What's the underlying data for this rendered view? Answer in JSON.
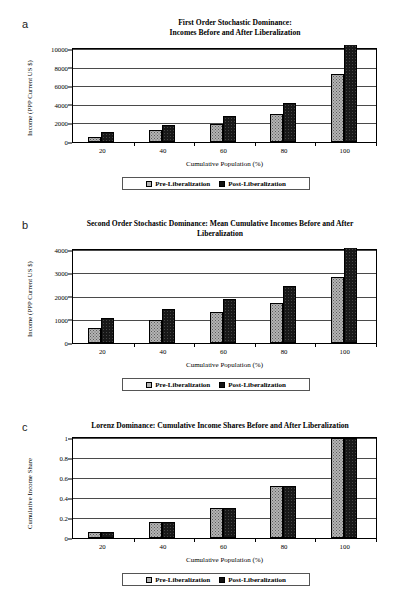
{
  "figure": {
    "legend": {
      "pre_label": "Pre-Liberalization",
      "post_label": "Post-Liberalization",
      "pre_color": "#b4b4b4",
      "post_color": "#181818"
    },
    "xaxis_title": "Cumulative Population (%)"
  },
  "panels": [
    {
      "letter": "a",
      "title": "First Order Stochastic Dominance:\nIncomes Before and After Liberalization",
      "title_line1": "First Order Stochastic Dominance:",
      "title_line2": "Incomes Before and After Liberalization",
      "ylabel": "Income (PPP Current US $)",
      "xlabel": "Cumulative Population (%)"
    },
    {
      "letter": "b",
      "title_line1": "Second Order Stochastic Dominance: Mean Cumulative Incomes Before and After",
      "title_line2": "Liberalization",
      "ylabel": "Income (PPP Current US $)",
      "xlabel": "Cumulative Population (%)"
    },
    {
      "letter": "c",
      "title_line1": "Lorenz Dominance: Cumulative Income Shares Before and After Liberalization",
      "title_line2": "",
      "ylabel": "Cumulative Income Share",
      "xlabel": "Cumulative Population (%)"
    }
  ],
  "chart_data": [
    {
      "type": "bar",
      "panel": "a",
      "title": "First Order Stochastic Dominance: Incomes Before and After Liberalization",
      "xlabel": "Cumulative Population (%)",
      "ylabel": "Income (PPP Current US $)",
      "categories": [
        "20",
        "40",
        "60",
        "80",
        "100"
      ],
      "series": [
        {
          "name": "Pre-Liberalization",
          "values": [
            560,
            1300,
            1950,
            3000,
            7300
          ]
        },
        {
          "name": "Post-Liberalization",
          "values": [
            1060,
            1850,
            2800,
            4150,
            10400
          ]
        }
      ],
      "ylim": [
        0,
        10000
      ],
      "yticks": [
        0,
        2000,
        4000,
        6000,
        8000,
        10000
      ],
      "ytick_labels": [
        "0",
        "2000",
        "4000",
        "6000",
        "8000",
        "10000"
      ],
      "grid": true,
      "legend_position": "bottom"
    },
    {
      "type": "bar",
      "panel": "b",
      "title": "Second Order Stochastic Dominance: Mean Cumulative Incomes Before and After Liberalization",
      "xlabel": "Cumulative Population (%)",
      "ylabel": "Income (PPP Current US $)",
      "categories": [
        "20",
        "40",
        "60",
        "80",
        "100"
      ],
      "series": [
        {
          "name": "Pre-Liberalization",
          "values": [
            660,
            980,
            1320,
            1730,
            2820
          ]
        },
        {
          "name": "Post-Liberalization",
          "values": [
            1060,
            1450,
            1880,
            2460,
            4080
          ]
        }
      ],
      "ylim": [
        0,
        4000
      ],
      "yticks": [
        0,
        1000,
        2000,
        3000,
        4000
      ],
      "ytick_labels": [
        "0",
        "1000",
        "2000",
        "3000",
        "4000"
      ],
      "grid": true,
      "legend_position": "bottom"
    },
    {
      "type": "bar",
      "panel": "c",
      "title": "Lorenz Dominance: Cumulative Income Shares Before and After Liberalization",
      "xlabel": "Cumulative Population (%)",
      "ylabel": "Cumulative Income Share",
      "categories": [
        "20",
        "40",
        "60",
        "80",
        "100"
      ],
      "series": [
        {
          "name": "Pre-Liberalization",
          "values": [
            0.06,
            0.165,
            0.305,
            0.52,
            1.0
          ]
        },
        {
          "name": "Post-Liberalization",
          "values": [
            0.06,
            0.158,
            0.303,
            0.52,
            1.0
          ]
        }
      ],
      "ylim": [
        0,
        1
      ],
      "yticks": [
        0,
        0.2,
        0.4,
        0.6,
        0.8,
        1
      ],
      "ytick_labels": [
        "0",
        "0.2",
        "0.4",
        "0.6",
        "0.8",
        "1"
      ],
      "grid": true,
      "legend_position": "bottom"
    }
  ]
}
